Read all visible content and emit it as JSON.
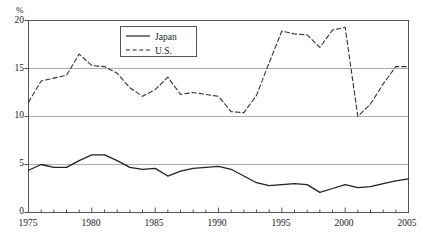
{
  "chart_data": {
    "type": "line",
    "title": "",
    "xlabel": "",
    "ylabel": "",
    "unit_label": "%",
    "xlim": [
      1975,
      2005
    ],
    "ylim": [
      0,
      20
    ],
    "yticks": [
      0,
      5,
      10,
      15,
      20
    ],
    "ytick_labels": [
      "0",
      "5",
      "10",
      "15",
      "20"
    ],
    "xticks": [
      1975,
      1980,
      1985,
      1990,
      1995,
      2000,
      2005
    ],
    "xtick_labels": [
      "1975",
      "1980",
      "1985",
      "1990",
      "1995",
      "2000",
      "2005"
    ],
    "x_minor_tick_interval": 1,
    "grid": "horizontal",
    "gridlines": [
      5,
      10,
      15
    ],
    "legend_position": "top-center",
    "x": [
      1975,
      1976,
      1977,
      1978,
      1979,
      1980,
      1981,
      1982,
      1983,
      1984,
      1985,
      1986,
      1987,
      1988,
      1989,
      1990,
      1991,
      1992,
      1993,
      1994,
      1995,
      1996,
      1997,
      1998,
      1999,
      2000,
      2001,
      2002,
      2003,
      2004,
      2005
    ],
    "series": [
      {
        "name": "Japan",
        "style": "solid",
        "color": "#222222",
        "values": [
          4.4,
          5.0,
          4.7,
          4.7,
          5.4,
          6.0,
          6.0,
          5.4,
          4.7,
          4.5,
          4.6,
          3.8,
          4.3,
          4.6,
          4.7,
          4.8,
          4.5,
          3.8,
          3.1,
          2.8,
          2.9,
          3.0,
          2.9,
          2.1,
          2.5,
          2.9,
          2.6,
          2.7,
          3.0,
          3.3,
          3.5
        ]
      },
      {
        "name": "U.S.",
        "style": "dashed",
        "color": "#333333",
        "values": [
          11.5,
          13.7,
          14.0,
          14.3,
          16.5,
          15.3,
          15.2,
          14.5,
          13.0,
          12.1,
          12.8,
          14.1,
          12.3,
          12.5,
          12.3,
          12.1,
          10.5,
          10.4,
          12.2,
          15.6,
          18.9,
          18.6,
          18.5,
          17.2,
          19.0,
          19.3,
          10.0,
          11.3,
          13.4,
          15.2,
          15.2
        ]
      }
    ],
    "legend": [
      {
        "label": "Japan",
        "style": "solid"
      },
      {
        "label": "U.S.",
        "style": "dashed"
      }
    ]
  }
}
